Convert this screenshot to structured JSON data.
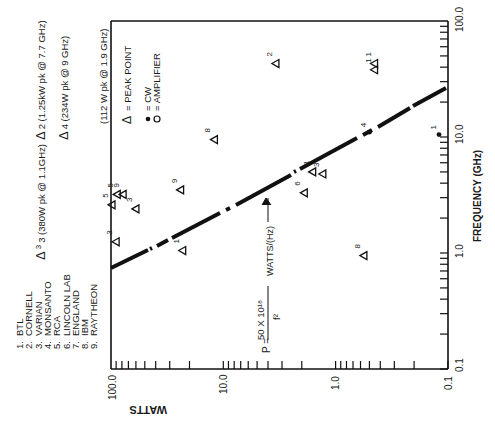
{
  "chart_data": {
    "type": "scatter",
    "orientation": "rotated 90° counter-clockwise (text reads bottom-to-top)",
    "xlabel": "WATTS",
    "ylabel": "FREQUENCY (GHz)",
    "x_scale": "log",
    "y_scale": "log",
    "xlim": [
      100.0,
      0.1
    ],
    "ylim": [
      0.1,
      100.0
    ],
    "x_ticks": [
      "100.0",
      "10.0",
      "1.0",
      "0.1"
    ],
    "y_ticks": [
      "0.1",
      "1.0",
      "10.0",
      "100.0"
    ],
    "grid": false,
    "equation": {
      "lhs": "P =",
      "numerator": "50 X 10¹⁸",
      "denominator": "f²",
      "units": "WATTS/(Hz)"
    },
    "legend": [
      {
        "symbol": "Δ",
        "label": "= PEAK POINT"
      },
      {
        "symbol": "●",
        "label": "= CW"
      },
      {
        "symbol": "○",
        "label": "= AMPLIFIER"
      }
    ],
    "organizations": [
      {
        "num": "1.",
        "name": "BTL"
      },
      {
        "num": "2.",
        "name": "CORNELL"
      },
      {
        "num": "3.",
        "name": "VARIAN"
      },
      {
        "num": "4.",
        "name": "MONSANTO"
      },
      {
        "num": "5.",
        "name": "RCA"
      },
      {
        "num": "6.",
        "name": "LINCOLN LAB"
      },
      {
        "num": "7.",
        "name": "ENGLAND"
      },
      {
        "num": "8.",
        "name": "IBM"
      },
      {
        "num": "9.",
        "name": "RAYTHEON"
      }
    ],
    "offscale_annotations": [
      {
        "symbol": "Δ",
        "id": "2",
        "text": "2 (1.25kW pk @ 7.7 GHz)"
      },
      {
        "symbol": "Δ",
        "id": "4",
        "text": "4 (234W pk @ 9 GHz)"
      },
      {
        "symbol": "",
        "id": "",
        "text": "(112 W pk @ 1.9 GHz)"
      },
      {
        "symbol": "Δ",
        "id": "3",
        "text": "3 (380W pk @ 1.1GHz)"
      }
    ],
    "series": [
      {
        "name": "Peak point",
        "marker": "triangle",
        "points": [
          {
            "label": "2",
            "watts": 3.4,
            "freq_ghz": 43
          },
          {
            "label": "1",
            "watts": 0.45,
            "freq_ghz": 38
          },
          {
            "label": "1",
            "watts": 0.45,
            "freq_ghz": 43
          },
          {
            "label": "8",
            "watts": 12,
            "freq_ghz": 9.5
          },
          {
            "label": "3",
            "watts": 1.3,
            "freq_ghz": 4.8
          },
          {
            "label": "1",
            "watts": 1.6,
            "freq_ghz": 5.0
          },
          {
            "label": "6",
            "watts": 1.9,
            "freq_ghz": 3.3
          },
          {
            "label": "9",
            "watts": 24,
            "freq_ghz": 3.5
          },
          {
            "label": "9",
            "watts": 78,
            "freq_ghz": 3.2
          },
          {
            "label": "5",
            "watts": 88,
            "freq_ghz": 3.2
          },
          {
            "label": "5",
            "watts": 98,
            "freq_ghz": 2.6
          },
          {
            "label": "3",
            "watts": 60,
            "freq_ghz": 2.4
          },
          {
            "label": "3",
            "watts": 90,
            "freq_ghz": 1.25
          },
          {
            "label": "1",
            "watts": 23,
            "freq_ghz": 1.05
          },
          {
            "label": "8",
            "watts": 0.56,
            "freq_ghz": 0.95
          }
        ]
      },
      {
        "name": "CW",
        "marker": "dot",
        "points": [
          {
            "label": "4",
            "watts": 0.5,
            "freq_ghz": 11
          },
          {
            "label": "1",
            "watts": 0.12,
            "freq_ghz": 10.5
          }
        ]
      },
      {
        "name": "Limit line P = 50x10^18 / f^2",
        "marker": "dashed-line",
        "points": [
          {
            "watts": 100,
            "freq_ghz": 0.72
          },
          {
            "watts": 0.1,
            "freq_ghz": 22
          }
        ]
      }
    ]
  }
}
